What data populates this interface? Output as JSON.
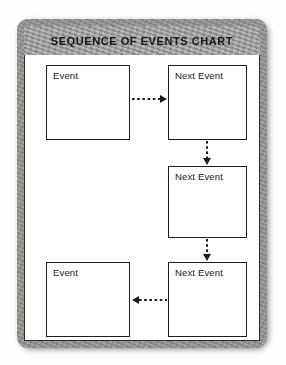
{
  "document": {
    "kind": "scanned-worksheet",
    "title": "SEQUENCE OF EVENTS CHART"
  },
  "colors": {
    "frame": "#8d8d8a",
    "title_band": "#9b9b98",
    "paper": "#ffffff",
    "ink": "#1e1e1e",
    "title_text": "#16161a"
  },
  "chart_data": {
    "type": "diagram",
    "title": "SEQUENCE OF EVENTS CHART",
    "layout": "2-column grid, 3 rows, serpentine flow",
    "nodes": [
      {
        "id": "n1",
        "label": "Event",
        "row": 1,
        "col": 1
      },
      {
        "id": "n2",
        "label": "Next Event",
        "row": 1,
        "col": 2
      },
      {
        "id": "n3",
        "label": "Next Event",
        "row": 2,
        "col": 2
      },
      {
        "id": "n4",
        "label": "Next Event",
        "row": 3,
        "col": 2
      },
      {
        "id": "n5",
        "label": "Event",
        "row": 3,
        "col": 1
      }
    ],
    "edges": [
      {
        "from": "n1",
        "to": "n2",
        "direction": "right",
        "style": "dotted"
      },
      {
        "from": "n2",
        "to": "n3",
        "direction": "down",
        "style": "dotted"
      },
      {
        "from": "n3",
        "to": "n4",
        "direction": "down",
        "style": "dotted"
      },
      {
        "from": "n4",
        "to": "n5",
        "direction": "left",
        "style": "dotted"
      }
    ]
  },
  "boxes": {
    "r1c1": {
      "label": "Event"
    },
    "r1c2": {
      "label": "Next Event"
    },
    "r2c2": {
      "label": "Next Event"
    },
    "r3c1": {
      "label": "Event"
    },
    "r3c2": {
      "label": "Next Event"
    }
  },
  "arrows": {
    "a1": {
      "name": "arrow-right-dotted"
    },
    "a2": {
      "name": "arrow-down-dotted"
    },
    "a3": {
      "name": "arrow-down-dotted"
    },
    "a4": {
      "name": "arrow-left-dotted"
    }
  }
}
